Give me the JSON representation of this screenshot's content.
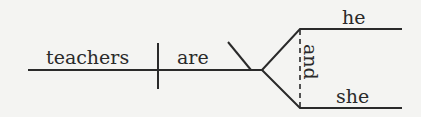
{
  "diagram": {
    "type": "sentence-diagram",
    "subject": "teachers",
    "verb": "are",
    "predicate_nominatives": [
      "he",
      "she"
    ],
    "conjunction": "and",
    "colors": {
      "ink": "#2a2a2a",
      "background": "#f4f4f2"
    }
  }
}
